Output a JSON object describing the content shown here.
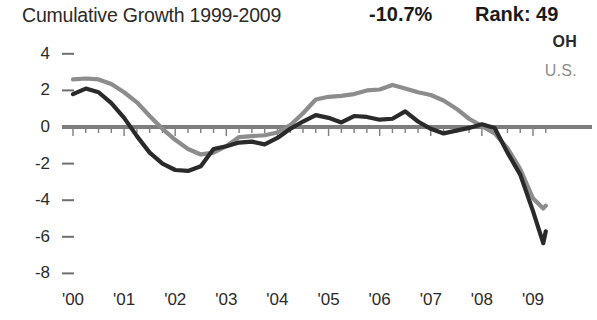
{
  "header": {
    "title": "Cumulative Growth 1999-2009",
    "percent": "-10.7%",
    "rank": "Rank: 49"
  },
  "legend": {
    "series1_label": "OH",
    "series1_color": "#2a2a2a",
    "series2_label": "U.S.",
    "series2_color": "#8c8c8c"
  },
  "chart_data": {
    "type": "line",
    "title": "Cumulative Growth 1999-2009",
    "xlabel": "",
    "ylabel": "",
    "ylim": [
      -8,
      4
    ],
    "xlim": [
      2000,
      2009.25
    ],
    "grid": false,
    "legend_position": "top-right",
    "yticks": [
      4,
      2,
      0,
      -2,
      -4,
      -6,
      -8
    ],
    "ytick_labels": [
      "4",
      "2",
      "0",
      "-2",
      "-4",
      "-6",
      "-8"
    ],
    "xticks": [
      2000,
      2001,
      2002,
      2003,
      2004,
      2005,
      2006,
      2007,
      2008,
      2009
    ],
    "xtick_labels": [
      "'00",
      "'01",
      "'02",
      "'03",
      "'04",
      "'05",
      "'06",
      "'07",
      "'08",
      "'09"
    ],
    "annotations": [
      {
        "text": "-10.7%",
        "role": "summary-percent"
      },
      {
        "text": "Rank: 49",
        "role": "summary-rank"
      }
    ],
    "x": [
      2000.0,
      2000.25,
      2000.5,
      2000.75,
      2001.0,
      2001.25,
      2001.5,
      2001.75,
      2002.0,
      2002.25,
      2002.5,
      2002.75,
      2003.0,
      2003.25,
      2003.5,
      2003.75,
      2004.0,
      2004.25,
      2004.5,
      2004.75,
      2005.0,
      2005.25,
      2005.5,
      2005.75,
      2006.0,
      2006.25,
      2006.5,
      2006.75,
      2007.0,
      2007.25,
      2007.5,
      2007.75,
      2008.0,
      2008.25,
      2008.5,
      2008.75,
      2009.0,
      2009.2
    ],
    "series": [
      {
        "name": "OH",
        "color": "#2a2a2a",
        "values": [
          1.8,
          2.1,
          1.9,
          1.3,
          0.5,
          -0.5,
          -1.4,
          -2.0,
          -2.35,
          -2.4,
          -2.15,
          -1.2,
          -1.05,
          -0.85,
          -0.8,
          -0.95,
          -0.6,
          -0.1,
          0.3,
          0.65,
          0.5,
          0.25,
          0.6,
          0.55,
          0.4,
          0.45,
          0.85,
          0.3,
          -0.1,
          -0.35,
          -0.2,
          -0.05,
          0.15,
          -0.05,
          -1.4,
          -2.6,
          -4.6,
          -6.35
        ]
      },
      {
        "name": "U.S.",
        "color": "#8c8c8c",
        "values": [
          2.6,
          2.65,
          2.6,
          2.35,
          1.9,
          1.35,
          0.6,
          -0.1,
          -0.7,
          -1.2,
          -1.5,
          -1.4,
          -1.05,
          -0.55,
          -0.5,
          -0.45,
          -0.3,
          0.1,
          0.75,
          1.5,
          1.65,
          1.7,
          1.8,
          2.0,
          2.05,
          2.3,
          2.1,
          1.9,
          1.75,
          1.45,
          1.0,
          0.45,
          0.05,
          -0.35,
          -1.15,
          -2.3,
          -3.9,
          -4.45
        ]
      }
    ],
    "series_endpoints": [
      {
        "name": "OH",
        "final_x": 2009.25,
        "final_value": -5.7
      },
      {
        "name": "U.S.",
        "final_x": 2009.25,
        "final_value": -4.3
      }
    ]
  }
}
